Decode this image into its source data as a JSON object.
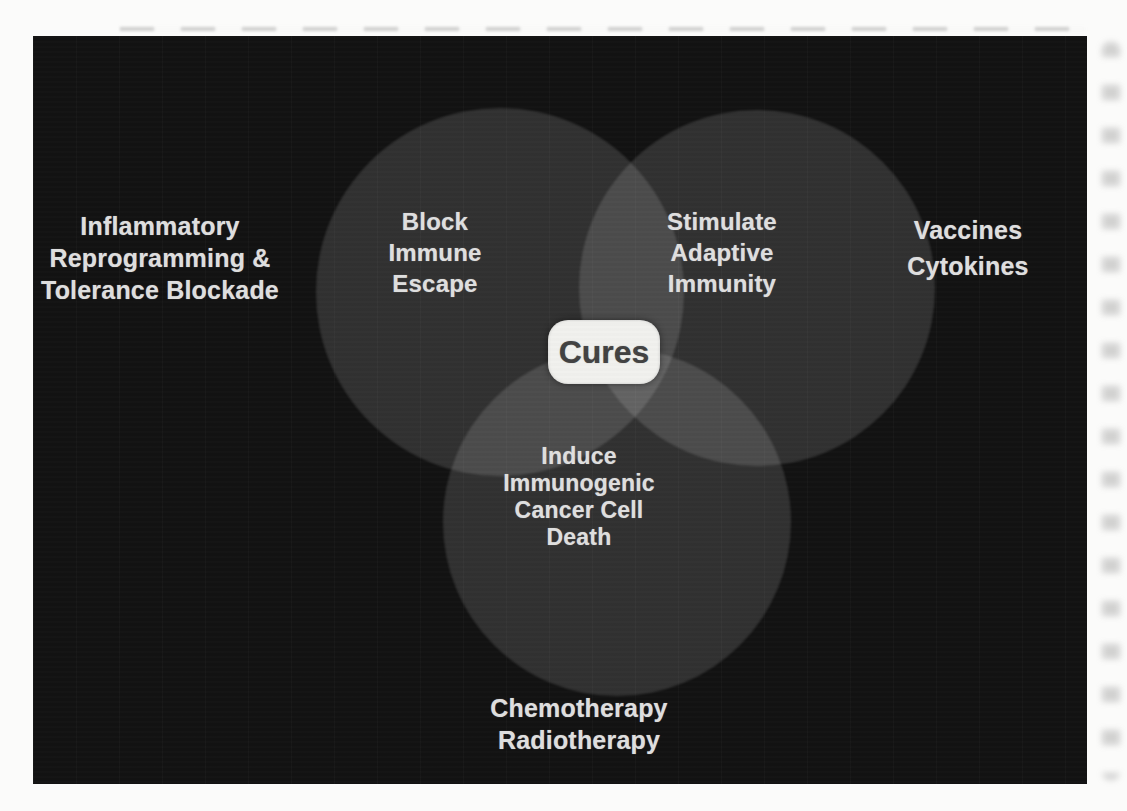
{
  "venn": {
    "center_label": "Cures",
    "circles": [
      {
        "id": "block-immune-escape",
        "lines": [
          "Block",
          "Immune",
          "Escape"
        ]
      },
      {
        "id": "stimulate-adaptive-immunity",
        "lines": [
          "Stimulate",
          "Adaptive",
          "Immunity"
        ]
      },
      {
        "id": "induce-immunogenic-cancer-cell-death",
        "lines": [
          "Induce",
          "Immunogenic",
          "Cancer Cell",
          "Death"
        ]
      }
    ],
    "outside_labels": [
      {
        "id": "left",
        "lines": [
          "Inflammatory",
          "Reprogramming &",
          "Tolerance Blockade"
        ]
      },
      {
        "id": "right",
        "lines": [
          "Vaccines",
          "Cytokines"
        ]
      },
      {
        "id": "bottom",
        "lines": [
          "Chemotherapy",
          "Radiotherapy"
        ]
      }
    ],
    "colors": {
      "page_bg": "#fbfbfa",
      "panel_bg": "#121212",
      "circle_fill": "rgba(255,255,255,0.135)",
      "label_text": "#dedede",
      "cures_box_bg": "#f1f1ee",
      "cures_text": "#424242"
    }
  }
}
